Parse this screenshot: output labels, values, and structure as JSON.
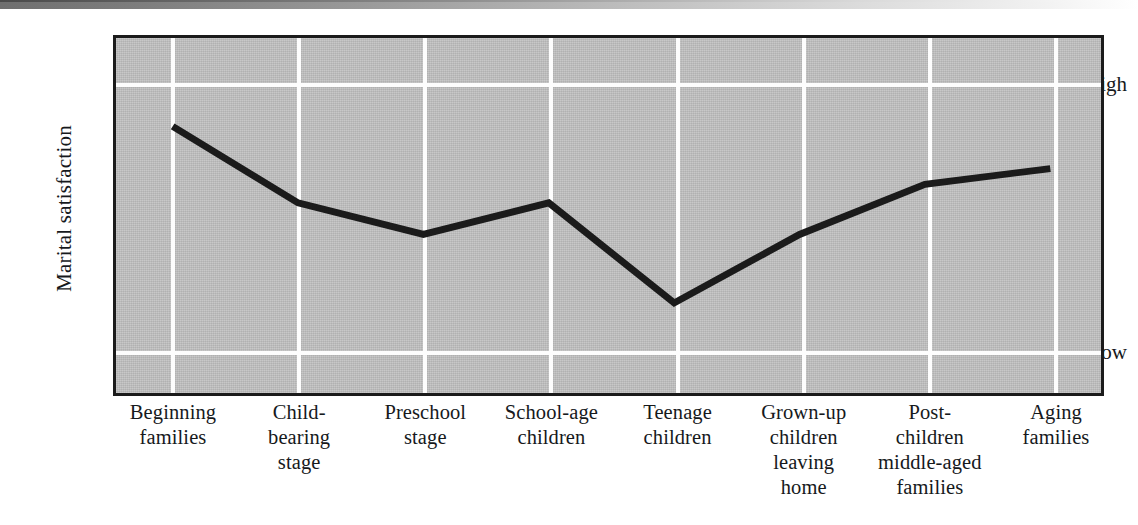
{
  "figure": {
    "y_axis_title": "Marital satisfaction",
    "y_ticks": {
      "high": "High",
      "low": "Low"
    }
  },
  "chart_data": {
    "type": "line",
    "title": "",
    "xlabel": "",
    "ylabel": "Marital satisfaction",
    "grid": true,
    "legend": "none",
    "ylim": [
      0,
      1
    ],
    "ytick_values": [
      0,
      1
    ],
    "ytick_labels": [
      "Low",
      "High"
    ],
    "categories": [
      "Beginning families",
      "Child-bearing stage",
      "Preschool stage",
      "School-age children",
      "Teenage children",
      "Grown-up children leaving home",
      "Post-children middle-aged families",
      "Aging families"
    ],
    "category_lines": [
      [
        "Beginning",
        "families"
      ],
      [
        "Child-",
        "bearing",
        "stage"
      ],
      [
        "Preschool",
        "stage"
      ],
      [
        "School-age",
        "children"
      ],
      [
        "Teenage",
        "children"
      ],
      [
        "Grown-up",
        "children",
        "leaving",
        "home"
      ],
      [
        "Post-",
        "children",
        "middle-aged",
        "families"
      ],
      [
        "Aging",
        "families"
      ]
    ],
    "series": [
      {
        "name": "Marital satisfaction",
        "values": [
          0.84,
          0.55,
          0.43,
          0.55,
          0.17,
          0.43,
          0.62,
          0.68
        ],
        "color": "#1b1b1b",
        "line_width": 7
      }
    ],
    "plot_background": "#c2c2c2",
    "grid_color": "#fdfdfd",
    "axis_color": "#1b1b1b"
  }
}
